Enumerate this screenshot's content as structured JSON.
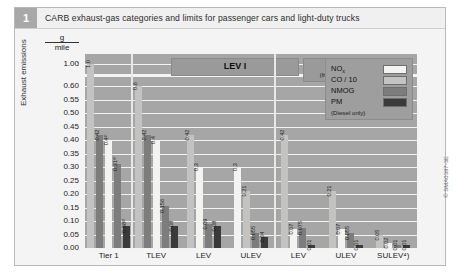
{
  "figure": {
    "number": "1",
    "caption": "CARB exhaust-gas categories and limits for passenger cars and light-duty trucks",
    "credit": "© SMA0397-3E"
  },
  "axes": {
    "y_label": "Exhaust emissions",
    "y_unit_numerator": "g",
    "y_unit_denominator": "mile",
    "y_ticks": [
      "1.00",
      "0.60",
      "0.55",
      "0.50",
      "0.45",
      "0.40",
      "0.35",
      "0.30",
      "0.25",
      "0.20",
      "0.15",
      "0.10",
      "0.05",
      "0.00"
    ],
    "axis_break": ":"
  },
  "sections": [
    {
      "id": "lev1",
      "title": "LEV I",
      "subtitle": ""
    },
    {
      "id": "lev2",
      "title": "LEV II",
      "subtitle": "(from Model Year 2004)"
    }
  ],
  "legend": {
    "position": "top-right",
    "entries": [
      {
        "name": "NOx",
        "label": "NO",
        "sub": "x",
        "color": "#f3f3f1",
        "key": "nox"
      },
      {
        "name": "CO/10",
        "label": "CO / 10",
        "sub": "",
        "color": "#c3c3c1",
        "key": "co"
      },
      {
        "name": "NMOG",
        "label": "NMOG",
        "sub": "",
        "color": "#7d7d7d",
        "key": "nmog"
      },
      {
        "name": "PM",
        "label": "PM",
        "sub": "",
        "color": "#3a3a3a",
        "key": "pm"
      }
    ],
    "footnote": "(Diesel only)"
  },
  "chart_data": {
    "type": "bar",
    "title": "CARB exhaust-gas categories and limits for passenger cars and light-duty trucks",
    "xlabel": "",
    "ylabel": "Exhaust emissions",
    "yunit": "g/mile",
    "ylim": [
      0,
      1.0
    ],
    "axis_break": {
      "between": [
        0.6,
        1.0
      ],
      "note": "scale break above 0.60"
    },
    "grid": true,
    "legend_position": "top-right",
    "categories": [
      "Tier 1",
      "TLEV",
      "LEV",
      "ULEV",
      "LEV",
      "ULEV",
      "SULEV⁴)"
    ],
    "category_sections": [
      "",
      "LEV I",
      "LEV I",
      "LEV I",
      "LEV II",
      "LEV II",
      "LEV II"
    ],
    "series": [
      {
        "name": "NOx",
        "values": [
          0.4,
          0.4,
          0.3,
          0.3,
          0.05,
          0.05,
          0.02
        ],
        "labels": [
          "0.4²⁾",
          "0.4",
          "0.3",
          "0.3",
          "0.07",
          "0.07",
          "0.02"
        ]
      },
      {
        "name": "CO / 10",
        "values": [
          1.0,
          0.6,
          0.42,
          0.21,
          0.42,
          0.21,
          0.1
        ],
        "labels": [
          "1.0",
          "0.6",
          "0.42",
          "0.21",
          "0.42",
          "0.21",
          "0.1"
        ]
      },
      {
        "name": "NMOG",
        "values": [
          0.31,
          0.156,
          0.09,
          0.055,
          0.075,
          0.055,
          0.01
        ],
        "labels": [
          "0.31³⁾",
          "0.156",
          "0.09",
          "0.055",
          "0.075",
          "0.055",
          "0.01"
        ]
      },
      {
        "name": "PM",
        "values": [
          0.08,
          0.08,
          0.08,
          0.04,
          0.01,
          0.01,
          0.01
        ],
        "labels": [
          "0.08¹⁾",
          "0.08",
          "0.08",
          "0.04",
          "0.01",
          "0.01",
          "0.01"
        ]
      }
    ],
    "extra_labels": {
      "tier1_nmog_top": "0.42",
      "tlev_nmog_top": "0.42"
    }
  },
  "bars": [
    {
      "group": "Tier 1",
      "section": "",
      "items": [
        {
          "key": "co",
          "label": "1.0",
          "value": 1.0,
          "overflow": true
        },
        {
          "key": "nmog",
          "label": "0.42",
          "value": 0.42
        },
        {
          "key": "nox",
          "label": "0.4²⁾",
          "value": 0.4
        },
        {
          "key": "nmog2",
          "label": "0.31³⁾",
          "value": 0.31
        },
        {
          "key": "pm",
          "label": "0.08¹⁾",
          "value": 0.08
        }
      ]
    },
    {
      "group": "TLEV",
      "section": "LEV I",
      "items": [
        {
          "key": "co",
          "label": "0.6",
          "value": 0.6
        },
        {
          "key": "nmog",
          "label": "0.42",
          "value": 0.42
        },
        {
          "key": "nox",
          "label": "0.4",
          "value": 0.4
        },
        {
          "key": "nmog2",
          "label": "0.156",
          "value": 0.156
        },
        {
          "key": "pm",
          "label": "0.08",
          "value": 0.08
        }
      ]
    },
    {
      "group": "LEV",
      "section": "LEV I",
      "items": [
        {
          "key": "co",
          "label": "0.42",
          "value": 0.42
        },
        {
          "key": "nox",
          "label": "0.3",
          "value": 0.3
        },
        {
          "key": "nmog",
          "label": "0.09",
          "value": 0.09
        },
        {
          "key": "pm",
          "label": "0.08",
          "value": 0.08
        }
      ]
    },
    {
      "group": "ULEV",
      "section": "LEV I",
      "items": [
        {
          "key": "nox",
          "label": "0.3",
          "value": 0.3
        },
        {
          "key": "co",
          "label": "0.21",
          "value": 0.21
        },
        {
          "key": "nmog",
          "label": "0.055",
          "value": 0.055
        },
        {
          "key": "pm",
          "label": "0.04",
          "value": 0.04
        }
      ]
    },
    {
      "group": "LEV",
      "section": "LEV II",
      "items": [
        {
          "key": "co",
          "label": "0.42",
          "value": 0.42
        },
        {
          "key": "nox",
          "label": "0.07",
          "value": 0.07
        },
        {
          "key": "nmog",
          "label": "0.075",
          "value": 0.075
        },
        {
          "key": "pm",
          "label": "0.01",
          "value": 0.01
        }
      ]
    },
    {
      "group": "ULEV",
      "section": "LEV II",
      "items": [
        {
          "key": "co",
          "label": "0.21",
          "value": 0.21
        },
        {
          "key": "nox",
          "label": "0.07",
          "value": 0.07
        },
        {
          "key": "nmog",
          "label": "0.055",
          "value": 0.055
        },
        {
          "key": "pm",
          "label": "0.01",
          "value": 0.01
        }
      ]
    },
    {
      "group": "SULEV⁴)",
      "section": "LEV II",
      "items": [
        {
          "key": "co",
          "label": "0.05",
          "value": 0.05
        },
        {
          "key": "nox",
          "label": "0.02",
          "value": 0.02
        },
        {
          "key": "nmog",
          "label": "0.01",
          "value": 0.01
        },
        {
          "key": "pm",
          "label": "0.01",
          "value": 0.01
        }
      ]
    }
  ]
}
